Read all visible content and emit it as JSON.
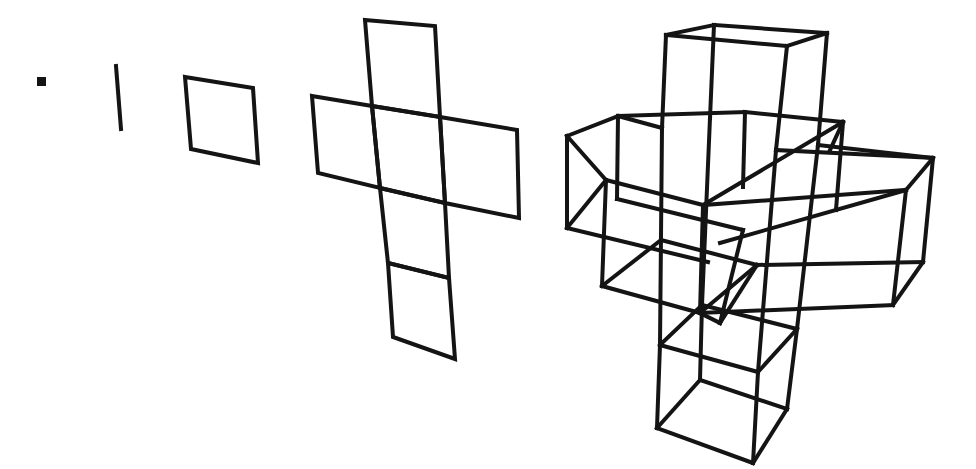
{
  "diagram": {
    "stroke_color": "#141414",
    "background": "#ffffff",
    "figures": [
      {
        "name": "point",
        "type": "rect",
        "x": 37,
        "y": 77,
        "w": 9,
        "h": 9
      },
      {
        "name": "line-segment",
        "type": "lines",
        "segments": [
          [
            116,
            66,
            121,
            129
          ]
        ]
      },
      {
        "name": "square",
        "type": "polygons",
        "polygons": [
          [
            [
              185,
              77
            ],
            [
              253,
              88
            ],
            [
              258,
              163
            ],
            [
              191,
              149
            ]
          ]
        ]
      },
      {
        "name": "cross-net",
        "type": "polygons",
        "polygons": [
          [
            [
              365,
              20
            ],
            [
              435,
              26
            ],
            [
              440,
              117
            ],
            [
              372,
              106
            ]
          ],
          [
            [
              312,
              96
            ],
            [
              372,
              106
            ],
            [
              380,
              188
            ],
            [
              318,
              173
            ]
          ],
          [
            [
              372,
              106
            ],
            [
              440,
              117
            ],
            [
              445,
              203
            ],
            [
              380,
              188
            ]
          ],
          [
            [
              440,
              117
            ],
            [
              517,
              130
            ],
            [
              519,
              218
            ],
            [
              445,
              203
            ]
          ],
          [
            [
              380,
              188
            ],
            [
              445,
              203
            ],
            [
              449,
              278
            ],
            [
              388,
              263
            ]
          ],
          [
            [
              388,
              263
            ],
            [
              449,
              278
            ],
            [
              455,
              359
            ],
            [
              393,
              337
            ]
          ]
        ]
      },
      {
        "name": "cube-cross-3d",
        "type": "lines",
        "segments": [
          [
            666,
            35,
            714,
            25
          ],
          [
            714,
            25,
            827,
            33
          ],
          [
            827,
            33,
            787,
            46
          ],
          [
            787,
            46,
            666,
            35
          ],
          [
            666,
            35,
            662,
            128
          ],
          [
            714,
            25,
            710,
            118
          ],
          [
            827,
            33,
            818,
            145
          ],
          [
            787,
            46,
            776,
            150
          ],
          [
            567,
            136,
            618,
            116
          ],
          [
            618,
            116,
            745,
            112
          ],
          [
            567,
            136,
            606,
            180
          ],
          [
            618,
            116,
            662,
            128
          ],
          [
            567,
            136,
            567,
            228
          ],
          [
            618,
            116,
            617,
            199
          ],
          [
            567,
            228,
            606,
            180
          ],
          [
            567,
            228,
            708,
            262
          ],
          [
            745,
            112,
            843,
            122
          ],
          [
            843,
            122,
            830,
            150
          ],
          [
            843,
            122,
            836,
            210
          ],
          [
            745,
            112,
            743,
            187
          ],
          [
            703,
            205,
            843,
            122
          ],
          [
            606,
            180,
            703,
            205
          ],
          [
            606,
            180,
            602,
            286
          ],
          [
            703,
            205,
            700,
            313
          ],
          [
            602,
            286,
            700,
            313
          ],
          [
            602,
            286,
            661,
            240
          ],
          [
            617,
            199,
            743,
            230
          ],
          [
            661,
            240,
            757,
            265
          ],
          [
            776,
            150,
            933,
            158
          ],
          [
            818,
            145,
            933,
            158
          ],
          [
            933,
            158,
            906,
            190
          ],
          [
            703,
            205,
            906,
            190
          ],
          [
            906,
            190,
            893,
            305
          ],
          [
            933,
            158,
            923,
            262
          ],
          [
            923,
            262,
            893,
            305
          ],
          [
            757,
            265,
            923,
            262
          ],
          [
            720,
            243,
            906,
            190
          ],
          [
            700,
            313,
            893,
            305
          ],
          [
            757,
            265,
            720,
            323
          ],
          [
            757,
            265,
            700,
            313
          ],
          [
            662,
            128,
            660,
            345
          ],
          [
            710,
            118,
            702,
            305
          ],
          [
            776,
            150,
            758,
            372
          ],
          [
            818,
            145,
            797,
            329
          ],
          [
            700,
            313,
            720,
            323
          ],
          [
            720,
            323,
            743,
            230
          ],
          [
            660,
            345,
            702,
            305
          ],
          [
            702,
            305,
            797,
            329
          ],
          [
            797,
            329,
            758,
            372
          ],
          [
            758,
            372,
            660,
            345
          ],
          [
            660,
            345,
            657,
            428
          ],
          [
            702,
            305,
            700,
            380
          ],
          [
            797,
            329,
            787,
            409
          ],
          [
            758,
            372,
            753,
            463
          ],
          [
            657,
            428,
            700,
            380
          ],
          [
            700,
            380,
            787,
            409
          ],
          [
            787,
            409,
            753,
            463
          ],
          [
            753,
            463,
            657,
            428
          ]
        ]
      }
    ]
  }
}
